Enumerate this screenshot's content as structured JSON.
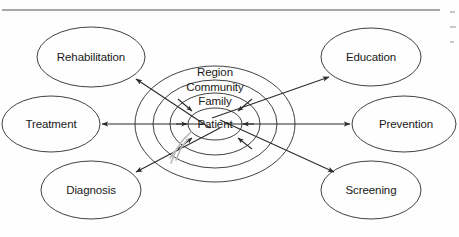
{
  "figure": {
    "background_color": "#fefefe",
    "stroke_color": "#2b2b2b",
    "rule_color": "#8a8a8a"
  },
  "rings": [
    {
      "id": "region",
      "label": "Region",
      "level": 1,
      "rx": 80,
      "ry": 58,
      "label_y": 73
    },
    {
      "id": "community",
      "label": "Community",
      "level": 2,
      "rx": 62,
      "ry": 44,
      "label_y": 88
    },
    {
      "id": "family",
      "label": "Family",
      "level": 3,
      "rx": 45,
      "ry": 31,
      "label_y": 101
    },
    {
      "id": "patient",
      "label": "Patient",
      "level": 4,
      "rx": 27,
      "ry": 16,
      "label_y": 124
    }
  ],
  "center": {
    "x": 215,
    "y": 124,
    "label": "Patient"
  },
  "nodes": [
    {
      "id": "rehabilitation",
      "label": "Rehabilitation",
      "cx": 91,
      "cy": 57,
      "rx": 54,
      "ry": 30,
      "position": "top-left"
    },
    {
      "id": "education",
      "label": "Education",
      "cx": 371,
      "cy": 57,
      "rx": 50,
      "ry": 29,
      "position": "top-right"
    },
    {
      "id": "treatment",
      "label": "Treatment",
      "cx": 51,
      "cy": 124,
      "rx": 49,
      "ry": 28,
      "position": "mid-left"
    },
    {
      "id": "prevention",
      "label": "Prevention",
      "cx": 404,
      "cy": 124,
      "rx": 52,
      "ry": 28,
      "position": "mid-right"
    },
    {
      "id": "diagnosis",
      "label": "Diagnosis",
      "cx": 91,
      "cy": 190,
      "rx": 50,
      "ry": 29,
      "position": "bottom-left"
    },
    {
      "id": "screening",
      "label": "Screening",
      "cx": 371,
      "cy": 190,
      "rx": 50,
      "ry": 29,
      "position": "bottom-right"
    }
  ],
  "connectors": [
    {
      "id": "rehabilitation-screening",
      "from": "rehabilitation",
      "to": "screening",
      "type": "double-headed-diagonal"
    },
    {
      "id": "education-diagnosis",
      "from": "education",
      "to": "diagnosis",
      "type": "double-headed-diagonal"
    },
    {
      "id": "treatment-prevention",
      "from": "treatment",
      "to": "prevention",
      "type": "double-headed-horizontal"
    }
  ],
  "inbound_arrows": [
    {
      "id": "inbound-upper-left",
      "direction": "from-upper-left"
    },
    {
      "id": "inbound-upper-right",
      "direction": "from-upper-right"
    },
    {
      "id": "inbound-left",
      "direction": "from-left"
    },
    {
      "id": "inbound-right",
      "direction": "from-right"
    },
    {
      "id": "inbound-lower-left",
      "direction": "from-lower-left"
    },
    {
      "id": "inbound-lower-right",
      "direction": "from-lower-right"
    }
  ],
  "artifacts": {
    "top_rule": {
      "x1": 2,
      "y1": 10,
      "x2": 440,
      "y2": 10
    },
    "scan_smudge": {
      "x": 168,
      "y": 131,
      "width": 28,
      "height": 34
    },
    "caption_fragments": [
      "",
      "",
      ""
    ]
  }
}
